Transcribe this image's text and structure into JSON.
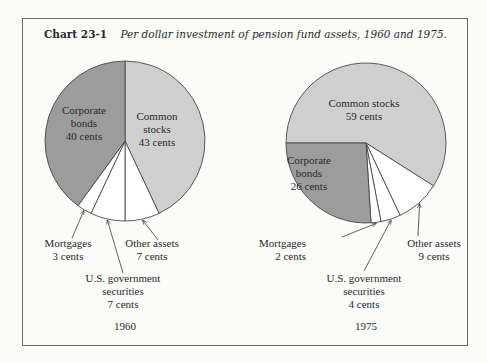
{
  "figure": {
    "number": "Chart 23-1",
    "caption": "Per dollar investment of pension fund assets, 1960 and 1975."
  },
  "colors": {
    "common_stocks": "#cfcfcf",
    "corporate_bonds": "#9c9c9c",
    "other": "#ffffff",
    "outline": "#4a4a4a"
  },
  "chart_data": [
    {
      "type": "pie",
      "title": "1960",
      "unit": "cents",
      "start_angle_deg": 0,
      "direction": "clockwise",
      "slices": [
        {
          "label": "Common stocks",
          "value": 43,
          "text_lines": [
            "Common",
            "stocks",
            "43 cents"
          ],
          "fill": "common_stocks"
        },
        {
          "label": "Other assets",
          "value": 7,
          "text_lines": [
            "Other assets",
            "7 cents"
          ],
          "fill": "other"
        },
        {
          "label": "U.S. government securities",
          "value": 7,
          "text_lines": [
            "U.S. government",
            "securities",
            "7 cents"
          ],
          "fill": "other"
        },
        {
          "label": "Mortgages",
          "value": 3,
          "text_lines": [
            "Mortgages",
            "3 cents"
          ],
          "fill": "other"
        },
        {
          "label": "Corporate bonds",
          "value": 40,
          "text_lines": [
            "Corporate",
            "bonds",
            "40 cents"
          ],
          "fill": "corporate_bonds"
        }
      ]
    },
    {
      "type": "pie",
      "title": "1975",
      "unit": "cents",
      "start_angle_deg": 270,
      "direction": "clockwise",
      "slices": [
        {
          "label": "Common stocks",
          "value": 59,
          "text_lines": [
            "Common stocks",
            "59 cents"
          ],
          "fill": "common_stocks"
        },
        {
          "label": "Other assets",
          "value": 9,
          "text_lines": [
            "Other assets",
            "9 cents"
          ],
          "fill": "other"
        },
        {
          "label": "U.S. government securities",
          "value": 4,
          "text_lines": [
            "U.S. government",
            "securities",
            "4 cents"
          ],
          "fill": "other"
        },
        {
          "label": "Mortgages",
          "value": 2,
          "text_lines": [
            "Mortgages",
            "2 cents"
          ],
          "fill": "other"
        },
        {
          "label": "Corporate bonds",
          "value": 26,
          "text_lines": [
            "Corporate",
            "bonds",
            "26 cents"
          ],
          "fill": "corporate_bonds"
        }
      ]
    }
  ]
}
